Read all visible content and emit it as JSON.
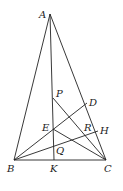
{
  "diagram": {
    "type": "geometry",
    "points": {
      "A": {
        "label": "A",
        "x": 50,
        "y": 14
      },
      "B": {
        "label": "B",
        "x": 14,
        "y": 160
      },
      "C": {
        "label": "C",
        "x": 106,
        "y": 160
      },
      "K": {
        "label": "K",
        "x": 54,
        "y": 160
      },
      "P": {
        "label": "P",
        "x": 53,
        "y": 98
      },
      "D": {
        "label": "D",
        "x": 87,
        "y": 103
      },
      "E": {
        "label": "E",
        "x": 53,
        "y": 129
      },
      "R": {
        "label": "R",
        "x": 87,
        "y": 132
      },
      "H": {
        "label": "H",
        "x": 98,
        "y": 131
      },
      "Q": {
        "label": "Q",
        "x": 53.5,
        "y": 150
      }
    },
    "segments": [
      [
        "A",
        "B"
      ],
      [
        "A",
        "C"
      ],
      [
        "B",
        "C"
      ],
      [
        "A",
        "K"
      ],
      [
        "B",
        "D"
      ],
      [
        "B",
        "H"
      ],
      [
        "P",
        "C"
      ],
      [
        "E",
        "C"
      ]
    ]
  }
}
